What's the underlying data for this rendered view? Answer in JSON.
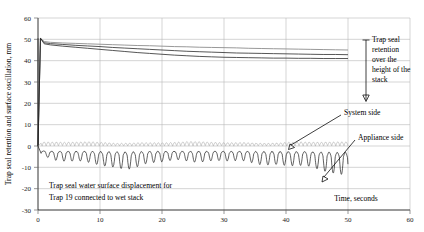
{
  "chart_data": {
    "type": "line",
    "title": "",
    "xlabel": "Time, seconds",
    "ylabel": "Trap seal retention and surface oscillation, mm",
    "xlim": [
      0,
      60
    ],
    "ylim": [
      -30,
      60
    ],
    "xticks": [
      0,
      10,
      20,
      30,
      40,
      50,
      60
    ],
    "xtick_labels": [
      "0",
      "10",
      "20",
      "30",
      "40",
      "50",
      "60"
    ],
    "yticks": [
      -30,
      -20,
      -10,
      0,
      10,
      20,
      30,
      40,
      50,
      60
    ],
    "ytick_labels": [
      "-30",
      "-20",
      "-10",
      "0",
      "10",
      "20",
      "30",
      "40",
      "50",
      "60"
    ],
    "grid": true,
    "legend_position": "none",
    "annotations": [
      {
        "name": "retention-annotation",
        "text": "Trap seal retention over the height of the stack",
        "lines": [
          "Trap seal",
          "retention",
          "over the",
          "height of the",
          "stack"
        ]
      },
      {
        "name": "system-side-label",
        "text": "System side"
      },
      {
        "name": "appliance-side-label",
        "text": "Appliance side"
      },
      {
        "name": "plot-caption",
        "text": "Trap seal water surface displacement for Trap 19 connected to wet stack",
        "lines": [
          "Trap seal water surface displacement for",
          "Trap 19 connected to wet stack"
        ]
      }
    ],
    "series": [
      {
        "name": "Trap seal retention band - upper (system side)",
        "color": "#8c8c8c",
        "description": "Retention traces rising from 0 to about 50 mm at t=0 then decaying to about 45 mm by t=50",
        "x": [
          0,
          0.4,
          1,
          2,
          4,
          6,
          8,
          10,
          12,
          14,
          16,
          18,
          20,
          22,
          24,
          26,
          28,
          30,
          32,
          34,
          36,
          38,
          40,
          42,
          44,
          46,
          48,
          50
        ],
        "y": [
          0,
          50.5,
          49.0,
          48.6,
          48.3,
          48.1,
          47.9,
          47.7,
          47.5,
          47.3,
          47.1,
          47.0,
          46.8,
          46.6,
          46.5,
          46.3,
          46.2,
          46.1,
          46.0,
          45.8,
          45.7,
          45.6,
          45.5,
          45.4,
          45.3,
          45.2,
          45.1,
          45.0
        ]
      },
      {
        "name": "Trap seal retention band - middle",
        "color": "#2b2b2b",
        "description": "Middle retention trace",
        "x": [
          0,
          0.4,
          1,
          2,
          4,
          6,
          8,
          10,
          12,
          14,
          16,
          18,
          20,
          22,
          24,
          26,
          28,
          30,
          32,
          34,
          36,
          38,
          40,
          42,
          44,
          46,
          48,
          50
        ],
        "y": [
          0,
          50.5,
          48.4,
          48.0,
          47.6,
          47.2,
          46.9,
          46.6,
          46.2,
          45.9,
          45.6,
          45.3,
          45.0,
          44.7,
          44.4,
          44.2,
          44.0,
          43.8,
          43.6,
          43.5,
          43.4,
          43.3,
          43.2,
          43.1,
          43.0,
          42.9,
          42.9,
          42.8
        ]
      },
      {
        "name": "Trap seal retention band - lower (appliance side)",
        "color": "#1a1a1a",
        "description": "Lower retention trace decaying to about 41 mm",
        "x": [
          0,
          0.4,
          1,
          2,
          4,
          6,
          8,
          10,
          12,
          14,
          16,
          18,
          20,
          22,
          24,
          26,
          28,
          30,
          32,
          34,
          36,
          38,
          40,
          42,
          44,
          46,
          48,
          50
        ],
        "y": [
          0,
          50.5,
          47.9,
          47.4,
          46.8,
          46.3,
          45.8,
          45.3,
          44.8,
          44.3,
          43.8,
          43.4,
          43.0,
          42.6,
          42.3,
          42.0,
          41.8,
          41.6,
          41.5,
          41.4,
          41.3,
          41.2,
          41.2,
          41.1,
          41.1,
          41.0,
          41.0,
          41.0
        ]
      },
      {
        "name": "System side oscillation",
        "color": "#a9a9a9",
        "description": "Light gray oscillation trace about the 0 mm line, amplitude roughly 0 to +2 mm, frequency about 1.5 Hz",
        "baseline": 0,
        "amplitude_range": [
          0,
          2
        ]
      },
      {
        "name": "Appliance side oscillation",
        "color": "#1a1a1a",
        "description": "Dark oscillation trace below 0 mm, mean about -4 mm, peak excursions to about -13 mm near t=14 and t=49",
        "baseline": -4,
        "amplitude_range": [
          -13,
          0
        ]
      }
    ]
  },
  "axis": {
    "y_title": "Trap seal retention and surface oscillation, mm",
    "x_title": "Time, seconds"
  },
  "labels": {
    "system_side": "System side",
    "appliance_side": "Appliance side",
    "retention_l1": "Trap seal",
    "retention_l2": "retention",
    "retention_l3": "over the",
    "retention_l4": "height of the",
    "retention_l5": "stack",
    "caption_l1": "Trap seal water surface displacement for",
    "caption_l2": "Trap 19 connected to wet stack"
  },
  "ticks": {
    "x": [
      "0",
      "10",
      "20",
      "30",
      "40",
      "50",
      "60"
    ],
    "y": [
      "60",
      "50",
      "40",
      "30",
      "20",
      "10",
      "0",
      "-10",
      "-20",
      "-30"
    ]
  },
  "colors": {
    "system": "#a9a9a9",
    "appliance": "#1a1a1a",
    "grid": "#b8b8b8",
    "axis": "#000000"
  }
}
